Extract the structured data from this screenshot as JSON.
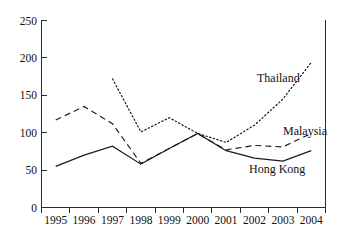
{
  "chart_data": {
    "type": "line",
    "title": "",
    "subtitle": "",
    "xlabel": "",
    "ylabel": "",
    "x": [
      "1995",
      "1996",
      "1997",
      "1998",
      "1999",
      "2000",
      "2001",
      "2002",
      "2003",
      "2004"
    ],
    "categories": [
      "1995",
      "1996",
      "1997",
      "1998",
      "1999",
      "2000",
      "2001",
      "2002",
      "2003",
      "2004"
    ],
    "xtick_labels": [
      "1995",
      "1996",
      "1997",
      "1998",
      "1999",
      "2000",
      "2001",
      "2002",
      "2003",
      "2004"
    ],
    "ytick_labels": [
      "0",
      "50",
      "100",
      "150",
      "200",
      "250"
    ],
    "ytick_values": [
      0,
      50,
      100,
      150,
      200,
      250
    ],
    "ylim": [
      0,
      250
    ],
    "grid": false,
    "legend_position": "inline-right",
    "series": [
      {
        "name": "Thailand",
        "style": "dotted",
        "x": [
          "1997",
          "1998",
          "1999",
          "2000",
          "2001",
          "2002",
          "2003",
          "2004"
        ],
        "values": [
          172,
          101,
          120,
          99,
          87,
          110,
          145,
          194
        ]
      },
      {
        "name": "Malaysia",
        "style": "dashed",
        "x": [
          "1995",
          "1996",
          "1997",
          "1998",
          "1999",
          "2000",
          "2001",
          "2002",
          "2003",
          "2004"
        ],
        "values": [
          117,
          135,
          112,
          59,
          79,
          99,
          77,
          83,
          81,
          99
        ]
      },
      {
        "name": "Hong Kong",
        "style": "solid",
        "x": [
          "1995",
          "1996",
          "1997",
          "1998",
          "1999",
          "2000",
          "2001",
          "2002",
          "2003",
          "2004"
        ],
        "values": [
          55,
          70,
          82,
          58,
          79,
          99,
          76,
          66,
          62,
          76
        ]
      }
    ],
    "annotations": [
      {
        "text": "Thailand",
        "series": "Thailand"
      },
      {
        "text": "Malaysia",
        "series": "Malaysia"
      },
      {
        "text": "Hong Kong",
        "series": "Hong Kong"
      }
    ],
    "colors": {
      "axis": "#2b2b2b",
      "line": "#1a1a1a",
      "background": "#ffffff"
    }
  },
  "figure": {
    "caption_fragment": ""
  }
}
